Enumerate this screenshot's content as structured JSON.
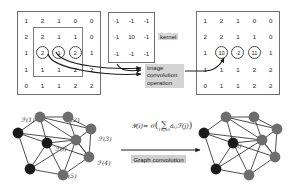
{
  "figure": {
    "colors": {
      "node_dark": "#1a1a1a",
      "node_gray": "#6d6d6d",
      "edge": "#3a3a3a",
      "box_gray": "#d4d4d4",
      "matrix_border": "#6e6e6e",
      "text": "#1a1a1a"
    }
  },
  "top": {
    "input_matrix": {
      "name": "input-image-matrix",
      "rows": [
        [
          {
            "v": "1"
          },
          {
            "v": "2"
          },
          {
            "v": "1"
          },
          {
            "v": "0"
          },
          {
            "v": "0"
          }
        ],
        [
          {
            "v": "2"
          },
          {
            "v": "2"
          },
          {
            "v": "1"
          },
          {
            "v": "1"
          },
          {
            "v": "0"
          }
        ],
        [
          {
            "v": "1"
          },
          {
            "v": "2",
            "circled": true
          },
          {
            "v": "1",
            "circled": true
          },
          {
            "v": "2",
            "circled": true
          },
          {
            "v": "1"
          }
        ],
        [
          {
            "v": "1"
          },
          {
            "v": "1"
          },
          {
            "v": "1"
          },
          {
            "v": "2"
          },
          {
            "v": "2"
          }
        ],
        [
          {
            "v": "0"
          },
          {
            "v": "1"
          },
          {
            "v": "1"
          },
          {
            "v": "2"
          },
          {
            "v": "2"
          }
        ]
      ]
    },
    "kernel_matrix": {
      "name": "convolution-kernel",
      "label": "kernel",
      "rows": [
        [
          {
            "v": "-1"
          },
          {
            "v": "-1"
          },
          {
            "v": "-1"
          }
        ],
        [
          {
            "v": "-1"
          },
          {
            "v": "10"
          },
          {
            "v": "-1"
          }
        ],
        [
          {
            "v": "-1"
          },
          {
            "v": "-1"
          },
          {
            "v": "-1"
          }
        ]
      ]
    },
    "operation_label": "image\nconvolution\noperation",
    "output_matrix": {
      "name": "output-feature-matrix",
      "rows": [
        [
          {
            "v": "1"
          },
          {
            "v": "2"
          },
          {
            "v": "1"
          },
          {
            "v": "0"
          },
          {
            "v": "0"
          }
        ],
        [
          {
            "v": "2"
          },
          {
            "v": "2"
          },
          {
            "v": "1"
          },
          {
            "v": "1"
          },
          {
            "v": "0"
          }
        ],
        [
          {
            "v": "1"
          },
          {
            "v": "10",
            "circled": true
          },
          {
            "v": "-2",
            "circled": true
          },
          {
            "v": "11",
            "circled": true
          },
          {
            "v": "1"
          }
        ],
        [
          {
            "v": "1"
          },
          {
            "v": "1"
          },
          {
            "v": "1"
          },
          {
            "v": "2"
          },
          {
            "v": "2"
          }
        ],
        [
          {
            "v": "0"
          },
          {
            "v": "1"
          },
          {
            "v": "1"
          },
          {
            "v": "2"
          },
          {
            "v": "2"
          }
        ]
      ]
    }
  },
  "bottom": {
    "left_graph": {
      "name": "input-graph",
      "labels": [
        {
          "text": "ℱ(1)"
        },
        {
          "text": "ℱ(2)"
        },
        {
          "text": "ℱ(3)"
        },
        {
          "text": "ℱ(4)"
        },
        {
          "text": "ℱ(5)"
        },
        {
          "text": "ℱ(i)"
        }
      ]
    },
    "formula": {
      "name": "graph-convolution-formula",
      "lhs": "𝒴(i)",
      "eq": "= σ",
      "sum": "∑",
      "sum_sub": "1≤j≤5",
      "rhs": "aᵢⱼℱ(j)"
    },
    "transform_label": "Graph convolution",
    "right_graph": {
      "name": "output-graph",
      "labels": [
        {
          "text": "𝒴(i)"
        }
      ]
    }
  }
}
